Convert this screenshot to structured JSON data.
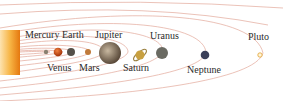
{
  "diagram": {
    "colors": {
      "orbit": "#e0a898",
      "sun_inner": "#f39a1e",
      "sun_outer": "#fde3b0",
      "label": "#2b2b2b"
    },
    "bodies": [
      {
        "name": "Mercury",
        "label": "Mercury",
        "label_pos": "above",
        "color": "#8a8070"
      },
      {
        "name": "Venus",
        "label": "Venus",
        "label_pos": "below",
        "color": "#d2581c"
      },
      {
        "name": "Earth",
        "label": "Earth",
        "label_pos": "above",
        "color": "#5a5550"
      },
      {
        "name": "Mars",
        "label": "Mars",
        "label_pos": "below",
        "color": "#c07a3a"
      },
      {
        "name": "Jupiter",
        "label": "Jupiter",
        "label_pos": "above",
        "color": "#8a7a68"
      },
      {
        "name": "Saturn",
        "label": "Saturn",
        "label_pos": "below",
        "color": "#c8a040"
      },
      {
        "name": "Uranus",
        "label": "Uranus",
        "label_pos": "above",
        "color": "#6a6a62"
      },
      {
        "name": "Neptune",
        "label": "Neptune",
        "label_pos": "below",
        "color": "#3a3f58"
      },
      {
        "name": "Pluto",
        "label": "Pluto",
        "label_pos": "above",
        "color": "#f0c060"
      }
    ]
  }
}
